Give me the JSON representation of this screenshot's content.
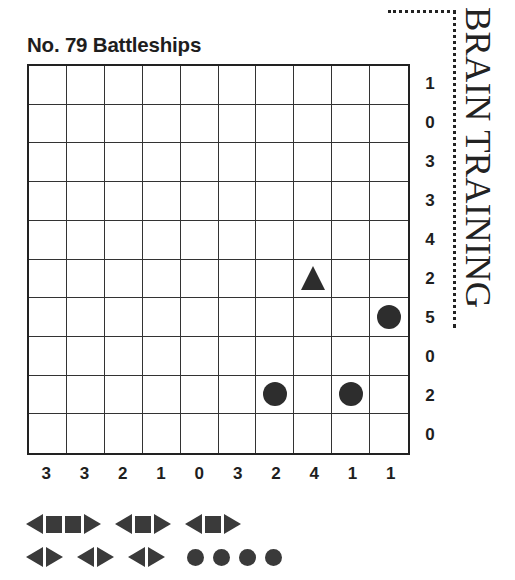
{
  "puzzle": {
    "title": "No. 79 Battleships",
    "brand": "BRAIN TRAINING",
    "grid_size": 10,
    "row_clues": [
      "1",
      "0",
      "3",
      "3",
      "4",
      "2",
      "5",
      "0",
      "2",
      "0"
    ],
    "col_clues": [
      "3",
      "3",
      "2",
      "1",
      "0",
      "3",
      "2",
      "4",
      "1",
      "1"
    ],
    "given_pieces": [
      {
        "row": 5,
        "col": 7,
        "shape": "end-up",
        "icon": "triangle-up-icon"
      },
      {
        "row": 6,
        "col": 9,
        "shape": "submarine",
        "icon": "circle-icon"
      },
      {
        "row": 8,
        "col": 6,
        "shape": "submarine",
        "icon": "circle-icon"
      },
      {
        "row": 8,
        "col": 8,
        "shape": "submarine",
        "icon": "circle-icon"
      }
    ],
    "piece_color": "#2d2d2d",
    "grid_line_color": "#333333"
  },
  "fleet": {
    "row1": [
      {
        "name": "battleship",
        "length": 4
      },
      {
        "name": "cruiser",
        "length": 3
      },
      {
        "name": "cruiser",
        "length": 3
      }
    ],
    "row2": [
      {
        "name": "destroyer",
        "length": 2
      },
      {
        "name": "destroyer",
        "length": 2
      },
      {
        "name": "destroyer",
        "length": 2
      },
      {
        "name": "submarines",
        "count": 4,
        "length": 1
      }
    ]
  }
}
